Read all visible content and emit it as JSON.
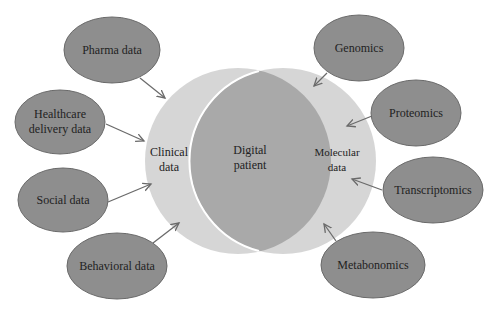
{
  "diagram": {
    "type": "venn-with-inputs",
    "colors": {
      "outer_node_fill": "#8e8e8e",
      "outer_node_stroke": "#6a6a6a",
      "circle_fill": "#d6d6d6",
      "intersection_fill": "#a9a9a9",
      "arrow": "#6a6a6a",
      "text": "#222222"
    },
    "center": {
      "left_circle": {
        "line1": "Clinical",
        "line2": "data"
      },
      "intersection": {
        "line1": "Digital",
        "line2": "patient"
      },
      "right_circle": {
        "line1": "Molecular",
        "line2": "data"
      }
    },
    "left_inputs": [
      {
        "line1": "Pharma data",
        "line2": ""
      },
      {
        "line1": "Healthcare",
        "line2": "delivery data"
      },
      {
        "line1": "Social data",
        "line2": ""
      },
      {
        "line1": "Behavioral data",
        "line2": ""
      }
    ],
    "right_inputs": [
      {
        "line1": "Genomics",
        "line2": ""
      },
      {
        "line1": "Proteomics",
        "line2": ""
      },
      {
        "line1": "Transcriptomics",
        "line2": ""
      },
      {
        "line1": "Metabonomics",
        "line2": ""
      }
    ]
  }
}
